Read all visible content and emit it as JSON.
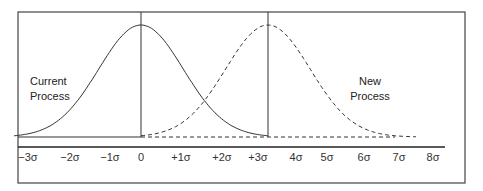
{
  "chart_data": {
    "type": "line",
    "title": "",
    "xlabel": "",
    "ylabel": "",
    "x_tick_labels": [
      "−3σ",
      "−2σ",
      "−1σ",
      "0",
      "+1σ",
      "+2σ",
      "+3σ",
      "4σ",
      "5σ",
      "6σ",
      "7σ",
      "8σ"
    ],
    "x_ticks": [
      -3,
      -2,
      -1,
      0,
      1,
      2,
      3,
      4,
      5,
      6,
      7,
      8
    ],
    "xlim": [
      -3,
      8
    ],
    "grid": false,
    "series": [
      {
        "name": "Current Process",
        "distribution": "normal",
        "mean": 0,
        "sd": 1,
        "range": [
          -3,
          3
        ],
        "style": "solid",
        "label_position": "left"
      },
      {
        "name": "New Process",
        "distribution": "normal",
        "mean": 3,
        "sd": 1,
        "range": [
          0,
          6.5
        ],
        "style": "dashed",
        "label_position": "right"
      }
    ],
    "reference_lines": [
      {
        "x": 0,
        "style": "solid"
      },
      {
        "x": 3,
        "style": "solid"
      }
    ]
  },
  "labels": {
    "current_line1": "Current",
    "current_line2": "Process",
    "new_line1": "New",
    "new_line2": "Process"
  },
  "axis": {
    "ticks": [
      "−3σ",
      "−2σ",
      "−1σ",
      "0",
      "+1σ",
      "+2σ",
      "+3σ",
      "4σ",
      "5σ",
      "6σ",
      "7σ",
      "8σ"
    ]
  }
}
